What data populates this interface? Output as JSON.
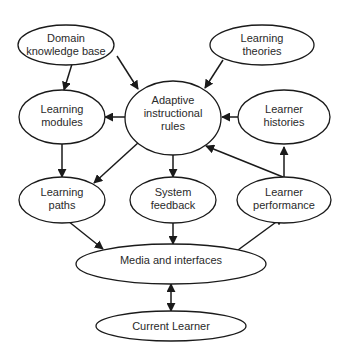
{
  "diagram": {
    "type": "flow",
    "nodes": [
      {
        "id": "domain",
        "line1": "Domain",
        "line2": "knowledge base"
      },
      {
        "id": "theories",
        "line1": "Learning",
        "line2": "theories"
      },
      {
        "id": "rules",
        "line1": "Adaptive",
        "line2": "instructional",
        "line3": "rules"
      },
      {
        "id": "modules",
        "line1": "Learning",
        "line2": "modules"
      },
      {
        "id": "histories",
        "line1": "Learner",
        "line2": "histories"
      },
      {
        "id": "paths",
        "line1": "Learning",
        "line2": "paths"
      },
      {
        "id": "feedback",
        "line1": "System",
        "line2": "feedback"
      },
      {
        "id": "performance",
        "line1": "Learner",
        "line2": "performance"
      },
      {
        "id": "media",
        "line1": "Media and interfaces"
      },
      {
        "id": "learner",
        "line1": "Current Learner"
      }
    ],
    "edges": [
      {
        "from": "domain",
        "to": "modules"
      },
      {
        "from": "domain",
        "to": "rules"
      },
      {
        "from": "theories",
        "to": "rules"
      },
      {
        "from": "rules",
        "to": "modules"
      },
      {
        "from": "histories",
        "to": "rules"
      },
      {
        "from": "modules",
        "to": "paths"
      },
      {
        "from": "rules",
        "to": "paths"
      },
      {
        "from": "rules",
        "to": "feedback"
      },
      {
        "from": "performance",
        "to": "rules"
      },
      {
        "from": "performance",
        "to": "histories"
      },
      {
        "from": "paths",
        "to": "media"
      },
      {
        "from": "feedback",
        "to": "media"
      },
      {
        "from": "media",
        "to": "performance"
      },
      {
        "from": "media",
        "to": "learner",
        "bidirectional": true
      }
    ],
    "colors": {
      "stroke": "#1a1a1a",
      "fill": "#ffffff",
      "text": "#2a2a2a"
    }
  }
}
